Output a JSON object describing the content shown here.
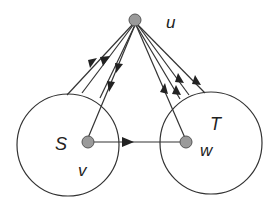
{
  "diagram": {
    "labels": {
      "u": "u",
      "S": "S",
      "T": "T",
      "v": "v",
      "w": "w"
    },
    "colors": {
      "stroke": "#333333",
      "node_fill": "#9a9a9a",
      "node_stroke": "#555555",
      "background": "#ffffff"
    },
    "nodes": [
      {
        "id": "u",
        "x": 135,
        "y": 20
      },
      {
        "id": "v",
        "x": 88,
        "y": 142
      },
      {
        "id": "w",
        "x": 186,
        "y": 142
      }
    ],
    "sets": [
      {
        "id": "S",
        "cx": 68,
        "cy": 145,
        "r": 51
      },
      {
        "id": "T",
        "cx": 211,
        "cy": 143,
        "r": 51
      }
    ],
    "edges": [
      {
        "from": "u",
        "to": "S-boundary",
        "direction": "toward S"
      },
      {
        "from": "u",
        "to": "S-boundary",
        "direction": "toward S"
      },
      {
        "from": "u",
        "to": "S-boundary",
        "direction": "toward S"
      },
      {
        "from": "u",
        "to": "v",
        "direction": "toward v"
      },
      {
        "from": "T-boundary",
        "to": "u",
        "direction": "toward u"
      },
      {
        "from": "T-boundary",
        "to": "u",
        "direction": "toward u"
      },
      {
        "from": "T-boundary",
        "to": "u",
        "direction": "toward u"
      },
      {
        "from": "w",
        "to": "u",
        "direction": "toward u"
      },
      {
        "from": "v",
        "to": "w",
        "direction": "toward w"
      }
    ]
  }
}
